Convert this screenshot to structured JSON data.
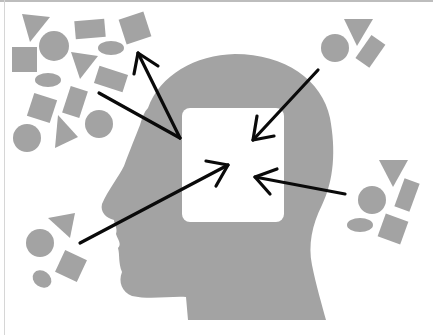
{
  "figure": {
    "colors": {
      "background": "#ffffff",
      "shape_fill": "#a3a3a3",
      "head_fill": "#a3a3a3",
      "mind_box": "#ffffff",
      "arrow": "#0a0a0a",
      "frame": "#bdbdbd"
    },
    "head": {
      "facing": "left"
    },
    "mind_box": {
      "x": 182,
      "y": 108,
      "width": 102,
      "height": 114,
      "radius": 8
    },
    "clusters": [
      {
        "name": "top-left",
        "role": "outgoing target",
        "shapes": [
          "triangle",
          "circle",
          "rectangle",
          "square",
          "ellipse",
          "triangle",
          "square",
          "ellipse",
          "rectangle",
          "square",
          "rectangle",
          "circle",
          "triangle",
          "circle"
        ]
      },
      {
        "name": "top-right",
        "role": "incoming source",
        "shapes": [
          "circle",
          "triangle",
          "rectangle"
        ]
      },
      {
        "name": "right",
        "role": "incoming source",
        "shapes": [
          "triangle",
          "rectangle",
          "circle",
          "ellipse",
          "square"
        ]
      },
      {
        "name": "bottom-left",
        "role": "incoming source",
        "shapes": [
          "triangle",
          "circle",
          "square",
          "ellipse"
        ]
      }
    ],
    "arrows": [
      {
        "name": "outgoing-to-top-left",
        "direction": "out"
      },
      {
        "name": "incoming-from-top-right",
        "direction": "in"
      },
      {
        "name": "incoming-from-right",
        "direction": "in"
      },
      {
        "name": "incoming-from-bottom-left",
        "direction": "in"
      }
    ]
  }
}
